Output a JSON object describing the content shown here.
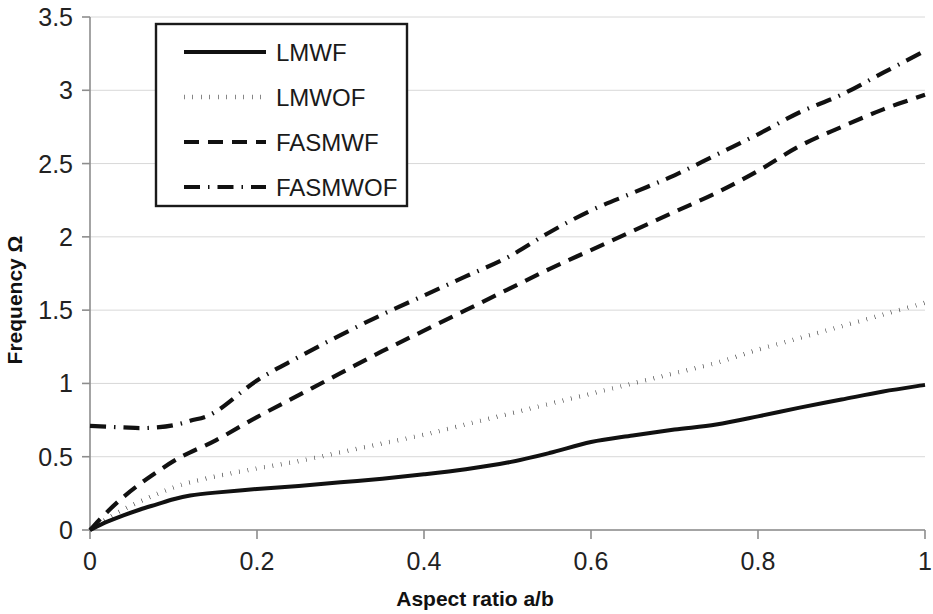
{
  "chart_data": {
    "type": "line",
    "title": "",
    "xlabel": "Aspect ratio a/b",
    "ylabel": "Frequency Ω",
    "xlim": [
      0,
      1
    ],
    "ylim": [
      0,
      3.5
    ],
    "xticks": [
      "0",
      "0.2",
      "0.4",
      "0.6",
      "0.8",
      "1"
    ],
    "xtick_values": [
      0,
      0.2,
      0.4,
      0.6,
      0.8,
      1
    ],
    "yticks": [
      "0",
      "0.5",
      "1",
      "1.5",
      "2",
      "2.5",
      "3",
      "3.5"
    ],
    "ytick_values": [
      0,
      0.5,
      1,
      1.5,
      2,
      2.5,
      3,
      3.5
    ],
    "grid": true,
    "grid_axis": "y",
    "legend_position": "top-left-inside",
    "x": [
      0,
      0.02,
      0.04,
      0.06,
      0.08,
      0.1,
      0.12,
      0.15,
      0.2,
      0.25,
      0.3,
      0.35,
      0.4,
      0.45,
      0.5,
      0.55,
      0.6,
      0.65,
      0.7,
      0.75,
      0.8,
      0.85,
      0.9,
      0.95,
      1
    ],
    "series": [
      {
        "name": "LMWF",
        "style": "solid",
        "values": [
          0,
          0.055,
          0.1,
          0.14,
          0.175,
          0.21,
          0.235,
          0.255,
          0.28,
          0.3,
          0.325,
          0.35,
          0.38,
          0.415,
          0.46,
          0.525,
          0.6,
          0.645,
          0.685,
          0.72,
          0.775,
          0.835,
          0.89,
          0.945,
          0.99
        ]
      },
      {
        "name": "LMWOF",
        "style": "dotted",
        "values": [
          0,
          0.075,
          0.14,
          0.195,
          0.245,
          0.29,
          0.325,
          0.365,
          0.42,
          0.47,
          0.53,
          0.59,
          0.65,
          0.72,
          0.79,
          0.86,
          0.93,
          1.0,
          1.07,
          1.14,
          1.23,
          1.31,
          1.39,
          1.47,
          1.55
        ]
      },
      {
        "name": "FASMWF",
        "style": "dashed",
        "values": [
          0,
          0.12,
          0.225,
          0.315,
          0.395,
          0.47,
          0.53,
          0.61,
          0.77,
          0.92,
          1.07,
          1.22,
          1.36,
          1.5,
          1.64,
          1.78,
          1.91,
          2.04,
          2.17,
          2.3,
          2.45,
          2.62,
          2.75,
          2.87,
          2.97
        ]
      },
      {
        "name": "FASMWOF",
        "style": "dashdot",
        "values": [
          0.71,
          0.705,
          0.7,
          0.695,
          0.7,
          0.715,
          0.745,
          0.805,
          1.02,
          1.18,
          1.33,
          1.47,
          1.6,
          1.73,
          1.86,
          2.03,
          2.18,
          2.3,
          2.42,
          2.56,
          2.7,
          2.85,
          2.97,
          3.12,
          3.27
        ]
      }
    ]
  },
  "legend": {
    "items": [
      {
        "label": "LMWF",
        "style": "solid"
      },
      {
        "label": "LMWOF",
        "style": "dotted"
      },
      {
        "label": "FASMWF",
        "style": "dashed"
      },
      {
        "label": "FASMWOF",
        "style": "dashdot"
      }
    ]
  },
  "colors": {
    "series": "#111111",
    "axis": "#8d8d8d",
    "grid": "#d8d8d8",
    "text": "#1a1a1a",
    "background": "#ffffff"
  }
}
